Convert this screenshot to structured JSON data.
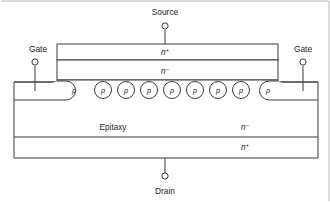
{
  "figure": {
    "background_color": "#ffffff",
    "line_color": "#3a3a3a"
  },
  "terminals": {
    "source": {
      "label": "Source",
      "x": 165,
      "y": 14,
      "node_x": 165,
      "node_y": 26,
      "lead_from_y": 30,
      "lead_to_y": 44
    },
    "gate_left": {
      "label": "Gate",
      "x": 38,
      "y": 51,
      "node_x": 35,
      "node_y": 62,
      "lead_from_y": 66,
      "lead_to_y": 91
    },
    "gate_right": {
      "label": "Gate",
      "x": 303,
      "y": 51,
      "node_x": 303,
      "node_y": 62,
      "lead_from_y": 66,
      "lead_to_y": 91
    },
    "drain": {
      "label": "Drain",
      "x": 165,
      "y": 192,
      "node_x": 165,
      "node_y": 176,
      "lead_from_y": 158,
      "lead_to_y": 173
    }
  },
  "layers": {
    "source_nplus": {
      "label": "n",
      "superscript": "+",
      "x": 165,
      "y": 55
    },
    "channel_nminus": {
      "label": "n",
      "superscript": "−",
      "x": 165,
      "y": 72
    },
    "epitaxy": {
      "label": "Epitaxy",
      "x": 113,
      "y": 129
    },
    "epitaxy_type": {
      "label": "n",
      "superscript": "−",
      "x": 245,
      "y": 129
    },
    "substrate_nplus": {
      "label": "n",
      "superscript": "+",
      "x": 245,
      "y": 148
    }
  },
  "p_regions": {
    "label": "p",
    "circles": [
      {
        "cx": 103,
        "cy": 90,
        "r": 8.5
      },
      {
        "cx": 126,
        "cy": 90,
        "r": 8.5
      },
      {
        "cx": 149,
        "cy": 90,
        "r": 8.5
      },
      {
        "cx": 172,
        "cy": 90,
        "r": 8.5
      },
      {
        "cx": 195,
        "cy": 90,
        "r": 8.5
      },
      {
        "cx": 218,
        "cy": 90,
        "r": 8.5
      },
      {
        "cx": 241,
        "cy": 90,
        "r": 8.5
      }
    ],
    "edge_left": {
      "label_x": 74,
      "label_y": 93
    },
    "edge_right": {
      "label_x": 268,
      "label_y": 93
    }
  },
  "geometry": {
    "mesa_left": 57,
    "mesa_right": 278,
    "mesa_top": 44,
    "nplus_bottom": 60,
    "nminus_bottom": 80,
    "body_left": 14,
    "body_right": 318,
    "body_top": 80,
    "ledge_y": 82,
    "epi_bottom": 137,
    "substrate_bottom": 158
  }
}
